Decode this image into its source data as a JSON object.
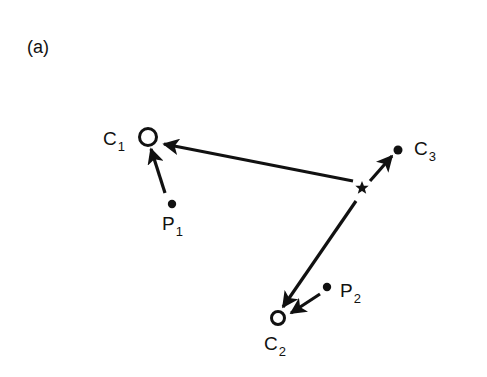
{
  "figure": {
    "panel_label": "(a)",
    "nodes": {
      "C1": {
        "label": "C",
        "subscript": "1",
        "type": "open-circle"
      },
      "C2": {
        "label": "C",
        "subscript": "2",
        "type": "open-circle"
      },
      "C3": {
        "label": "C",
        "subscript": "3",
        "type": "filled-dot"
      },
      "P1": {
        "label": "P",
        "subscript": "1",
        "type": "filled-dot"
      },
      "P2": {
        "label": "P",
        "subscript": "2",
        "type": "filled-dot"
      },
      "star": {
        "label": "",
        "type": "star"
      }
    },
    "edges": [
      {
        "from": "star",
        "to": "C1"
      },
      {
        "from": "star",
        "to": "C2"
      },
      {
        "from": "star",
        "to": "C3"
      },
      {
        "from": "P1",
        "to": "C1"
      },
      {
        "from": "P2",
        "to": "C2"
      }
    ],
    "colors": {
      "ink": "#111111",
      "background": "#ffffff"
    }
  }
}
